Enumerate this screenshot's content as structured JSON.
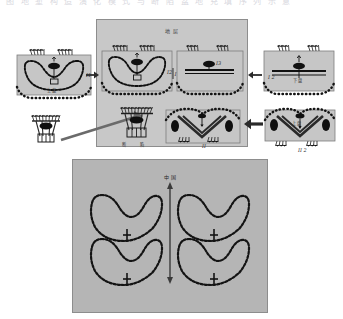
{
  "figure": {
    "caption_top": "图 地 堑 构 造 演 化 模 式 与 断 陷 盆 地 充 填 序 列 示 意",
    "background_color": "#ffffff",
    "panel_fill": "#c8c8c8",
    "bottom_panel_fill": "#b5b5b5",
    "border_color": "#8a8a8a",
    "ink_color": "#1a1a1a"
  },
  "main_block": {
    "name": "central-evolution-block",
    "title": "地 层",
    "sub_labels": {
      "bottom_left": "断",
      "bottom_right": "陷"
    }
  },
  "panels": [
    {
      "id": "left-syncline",
      "label_corner": "I1",
      "label_inner": "上 盘",
      "description": "syncline-basin-cross-section"
    },
    {
      "id": "center-syncline",
      "label_corner": "I2",
      "label_inner": "",
      "description": "syncline-basin-cross-section"
    },
    {
      "id": "center-flat",
      "label_corner": "I3",
      "label_inner": "",
      "description": "flat-layered-cross-section"
    },
    {
      "id": "center-v-graben",
      "label_corner": "II",
      "label_inner": "",
      "description": "v-shaped-graben-cross-section"
    },
    {
      "id": "right-flat",
      "label_corner": "I 2",
      "label_inner": "下 盘",
      "description": "flat-layered-cross-section"
    },
    {
      "id": "right-v-graben",
      "label_corner": "II 2",
      "label_inner": "上 盘",
      "description": "v-shaped-graben-cross-section"
    },
    {
      "id": "inset-small-diapir",
      "label_corner": "",
      "label_inner": "",
      "description": "small-diapir-inset"
    }
  ],
  "bottom_figure": {
    "name": "four-fold-array",
    "axis_label": "中 国",
    "axis_type": "double-headed-vertical-arrow",
    "units": [
      {
        "id": "fold-top-left",
        "label": ""
      },
      {
        "id": "fold-top-right",
        "label": ""
      },
      {
        "id": "fold-bottom-left",
        "label": ""
      },
      {
        "id": "fold-bottom-right",
        "label": ""
      }
    ]
  },
  "connectors": [
    {
      "id": "arrow-left-to-center",
      "direction": "right"
    },
    {
      "id": "arrow-right-to-center-upper",
      "direction": "left"
    },
    {
      "id": "arrow-right-to-center-lower",
      "direction": "left"
    },
    {
      "id": "pointer-inset-to-center",
      "direction": "up-right"
    }
  ]
}
